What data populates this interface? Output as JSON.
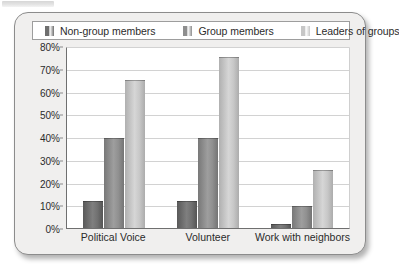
{
  "chart_data": {
    "type": "bar",
    "title": "",
    "subtitle": "",
    "xlabel": "",
    "ylabel": "",
    "categories": [
      "Political Voice",
      "Volunteer",
      "Work with neighbors"
    ],
    "series": [
      {
        "name": "Non-group members",
        "color": "#6f6f6f",
        "values": [
          12,
          12,
          2
        ]
      },
      {
        "name": "Group members",
        "color": "#8e8e8e",
        "values": [
          40,
          40,
          10
        ]
      },
      {
        "name": "Leaders of groups",
        "color": "#c6c6c6",
        "values": [
          66,
          76,
          26
        ]
      }
    ],
    "ylim": [
      0,
      80
    ],
    "y_ticks": [
      "0%",
      "10%",
      "20%",
      "30%",
      "40%",
      "50%",
      "60%",
      "70%",
      "80%"
    ],
    "y_tick_values": [
      0,
      10,
      20,
      30,
      40,
      50,
      60,
      70,
      80
    ],
    "grid": true,
    "legend_position": "top"
  },
  "legend": {
    "items": [
      {
        "label": "Non-group members",
        "color": "#6f6f6f"
      },
      {
        "label": "Group members",
        "color": "#8e8e8e"
      },
      {
        "label": "Leaders of groups",
        "color": "#c6c6c6"
      }
    ]
  },
  "colors": {
    "panel_background": "#f0efee",
    "plot_background": "#ffffff",
    "panel_border": "#8c8c8c",
    "axis": "#6f6f6f",
    "gridline": "#d2d2d2",
    "text": "#2b2b2b"
  }
}
